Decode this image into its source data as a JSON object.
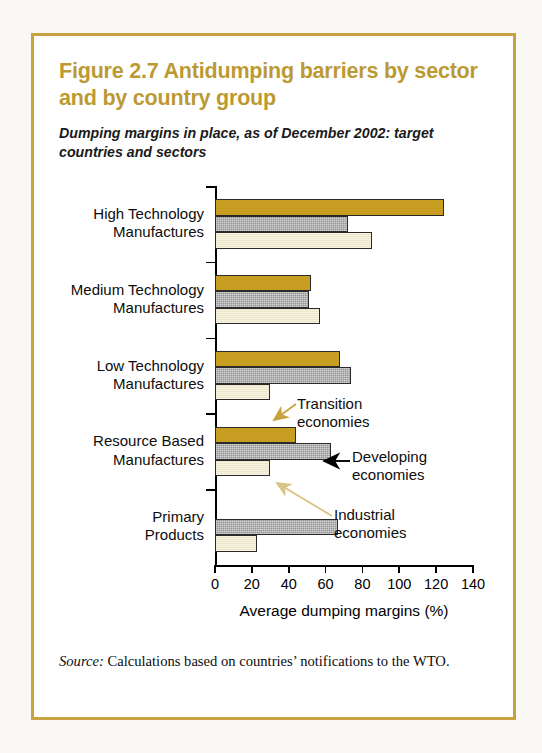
{
  "figure": {
    "title": "Figure 2.7  Antidumping barriers by sector and by country group",
    "subtitle": "Dumping margins in place, as of December 2002: target countries and sectors",
    "source_label": "Source:",
    "source_text": " Calculations based on countries’ notifications to the WTO.",
    "frame_color": "#C6A340",
    "title_color": "#BC9A33"
  },
  "annotations": [
    {
      "name": "transition",
      "text": "Transition\neconomies",
      "arrow_color": "#C6A340"
    },
    {
      "name": "developing",
      "text": "Developing\neconomies",
      "arrow_color": "#000000"
    },
    {
      "name": "industrial",
      "text": "Industrial\neconomies",
      "arrow_color": "#DCC98A"
    }
  ],
  "chart_data": {
    "type": "bar",
    "orientation": "horizontal",
    "title": "Figure 2.7  Antidumping barriers by sector and by country group",
    "subtitle": "Dumping margins in place, as of December 2002: target countries and sectors",
    "xlabel": "Average dumping margins (%)",
    "ylabel": "",
    "xlim": [
      0,
      140
    ],
    "xticks": [
      0,
      20,
      40,
      60,
      80,
      100,
      120,
      140
    ],
    "xtick_labels": [
      "0",
      "20",
      "40",
      "60",
      "80",
      "100",
      "120",
      "140"
    ],
    "grid": false,
    "legend": "annotations-with-arrows",
    "categories": [
      "High Technology\nManufactures",
      "Medium Technology\nManufactures",
      "Low Technology\nManufactures",
      "Resource Based\nManufactures",
      "Primary\nProducts"
    ],
    "series": [
      {
        "name": "Transition economies",
        "color": "#C79E22",
        "values": [
          124,
          52,
          68,
          44,
          null
        ]
      },
      {
        "name": "Developing economies",
        "color": "#949494",
        "values": [
          72,
          51,
          74,
          63,
          67
        ]
      },
      {
        "name": "Industrial economies",
        "color": "#EFE7CA",
        "values": [
          85,
          57,
          30,
          30,
          23
        ]
      }
    ]
  }
}
